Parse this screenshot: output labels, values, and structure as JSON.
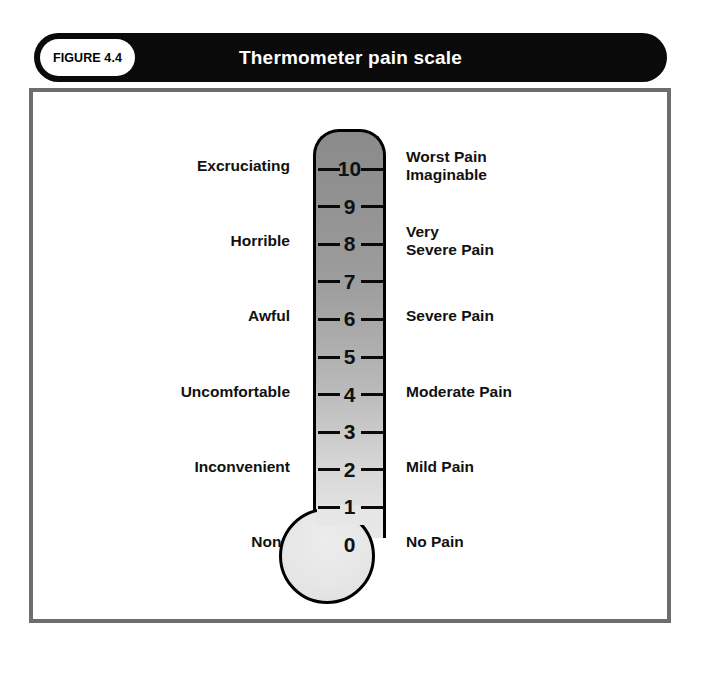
{
  "figure": {
    "badge_label": "FIGURE 4.4",
    "title": "Thermometer pain scale"
  },
  "colors": {
    "banner_bg": "#0a0a0a",
    "banner_text": "#ffffff",
    "badge_bg": "#ffffff",
    "frame_border": "#6d6d6d",
    "thermo_outline": "#000000",
    "thermo_top_gray": "#8b8b8b",
    "thermo_bottom_gray": "#e9e9e9",
    "bulb_gray": "#e6e6e6",
    "label_text": "#111111"
  },
  "chart_data": {
    "type": "table",
    "title": "Thermometer pain scale",
    "scale_min": 0,
    "scale_max": 10,
    "grid": false,
    "legend": "none",
    "columns": [
      "Patient descriptor",
      "Level",
      "Pain intensity"
    ],
    "levels": [
      {
        "value": "10",
        "left": "Excruciating",
        "right": "Worst Pain\nImaginable",
        "left_lines": 1,
        "right_lines": 2,
        "tick": true
      },
      {
        "value": "9",
        "left": "",
        "right": "",
        "left_lines": 0,
        "right_lines": 0,
        "tick": true
      },
      {
        "value": "8",
        "left": "Horrible",
        "right": "Very\nSevere Pain",
        "left_lines": 1,
        "right_lines": 2,
        "tick": true
      },
      {
        "value": "7",
        "left": "",
        "right": "",
        "left_lines": 0,
        "right_lines": 0,
        "tick": true
      },
      {
        "value": "6",
        "left": "Awful",
        "right": "Severe Pain",
        "left_lines": 1,
        "right_lines": 1,
        "tick": true
      },
      {
        "value": "5",
        "left": "",
        "right": "",
        "left_lines": 0,
        "right_lines": 0,
        "tick": true
      },
      {
        "value": "4",
        "left": "Uncomfortable",
        "right": "Moderate Pain",
        "left_lines": 1,
        "right_lines": 1,
        "tick": true
      },
      {
        "value": "3",
        "left": "",
        "right": "",
        "left_lines": 0,
        "right_lines": 0,
        "tick": true
      },
      {
        "value": "2",
        "left": "Inconvenient",
        "right": "Mild Pain",
        "left_lines": 1,
        "right_lines": 1,
        "tick": true
      },
      {
        "value": "1",
        "left": "",
        "right": "",
        "left_lines": 0,
        "right_lines": 0,
        "tick": true
      },
      {
        "value": "0",
        "left": "None",
        "right": "No Pain",
        "left_lines": 1,
        "right_lines": 1,
        "tick": false
      }
    ]
  }
}
